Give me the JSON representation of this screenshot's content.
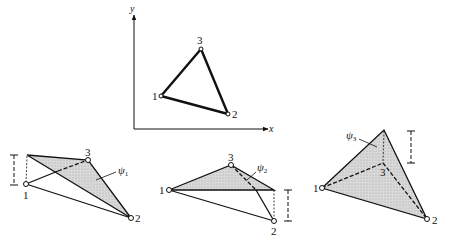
{
  "figure": {
    "top": {
      "x_axis_label": "x",
      "y_axis_label": "y",
      "nodes": [
        {
          "label": "1",
          "x": 161,
          "y": 96
        },
        {
          "label": "2",
          "x": 228,
          "y": 114
        },
        {
          "label": "3",
          "x": 201,
          "y": 49
        }
      ]
    },
    "panels": [
      {
        "name": "psi1",
        "shape_function": "ψ",
        "subscript": "1",
        "node_labels": [
          "1",
          "2",
          "3"
        ]
      },
      {
        "name": "psi2",
        "shape_function": "ψ",
        "subscript": "2",
        "node_labels": [
          "1",
          "2",
          "3"
        ]
      },
      {
        "name": "psi3",
        "shape_function": "ψ",
        "subscript": "3",
        "node_labels": [
          "1",
          "2",
          "3"
        ]
      }
    ],
    "colors": {
      "line": "#111111",
      "shade": "#d4d4d4"
    }
  }
}
